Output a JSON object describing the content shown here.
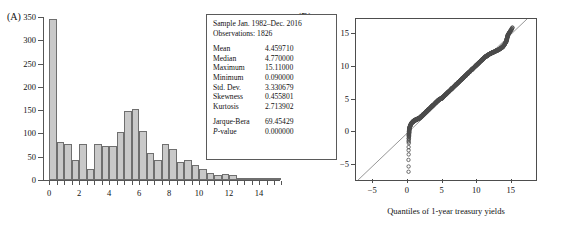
{
  "figure": {
    "panel_a_tag": "(A)",
    "panel_b_tag": "(B)"
  },
  "stats_box": {
    "sample": "Sample Jan. 1982–Dec. 2016",
    "observations": "Observations: 1826",
    "rows": [
      {
        "key": "Mean",
        "value": "4.459710"
      },
      {
        "key": "Median",
        "value": "4.770000"
      },
      {
        "key": "Maximum",
        "value": "15.11000"
      },
      {
        "key": "Minimum",
        "value": "0.090000"
      },
      {
        "key": "Std. Dev.",
        "value": "3.330679"
      },
      {
        "key": "Skewness",
        "value": "0.455801"
      },
      {
        "key": "Kurtosis",
        "value": "2.713902"
      }
    ],
    "test_rows": [
      {
        "key": "Jarque-Bera",
        "value": "69.45429"
      },
      {
        "key": "P-value",
        "value": "0.000000"
      }
    ]
  },
  "chart_data": [
    {
      "type": "bar",
      "title": "",
      "panel": "A",
      "xlabel": "",
      "ylabel": "",
      "xlim": [
        -0.35,
        15.4
      ],
      "ylim": [
        0,
        350
      ],
      "ytick_labels": [
        "0",
        "50",
        "100",
        "150",
        "200",
        "250",
        "300",
        "350"
      ],
      "yticks": [
        0,
        50,
        100,
        150,
        200,
        250,
        300,
        350
      ],
      "xtick_labels": [
        "0",
        "2",
        "4",
        "6",
        "8",
        "10",
        "12",
        "14"
      ],
      "xticks": [
        0,
        2,
        4,
        6,
        8,
        10,
        12,
        14
      ],
      "bin_width": 0.5,
      "bin_starts": [
        0.0,
        0.5,
        1.0,
        1.5,
        2.0,
        2.5,
        3.0,
        3.5,
        4.0,
        4.5,
        5.0,
        5.5,
        6.0,
        6.5,
        7.0,
        7.5,
        8.0,
        8.5,
        9.0,
        9.5,
        10.0,
        10.5,
        11.0,
        11.5,
        12.0,
        12.5,
        13.0,
        13.5,
        14.0,
        14.5,
        15.0
      ],
      "categories": [
        "0.0-0.5",
        "0.5-1.0",
        "1.0-1.5",
        "1.5-2.0",
        "2.0-2.5",
        "2.5-3.0",
        "3.0-3.5",
        "3.5-4.0",
        "4.0-4.5",
        "4.5-5.0",
        "5.0-5.5",
        "5.5-6.0",
        "6.0-6.5",
        "6.5-7.0",
        "7.0-7.5",
        "7.5-8.0",
        "8.0-8.5",
        "8.5-9.0",
        "9.0-9.5",
        "9.5-10.0",
        "10.0-10.5",
        "10.5-11.0",
        "11.0-11.5",
        "11.5-12.0",
        "12.0-12.5",
        "12.5-13.0",
        "13.0-13.5",
        "13.5-14.0",
        "14.0-14.5",
        "14.5-15.0",
        "15.0-15.5"
      ],
      "values": [
        346,
        81,
        77,
        44,
        78,
        23,
        77,
        74,
        74,
        104,
        148,
        152,
        105,
        57,
        42,
        77,
        66,
        38,
        43,
        33,
        23,
        15,
        10,
        12,
        10,
        4,
        4,
        3,
        3,
        3,
        2
      ],
      "bar_fill": "#c9c9c9",
      "bar_edge": "#6f6f6f",
      "grid": false
    },
    {
      "type": "scatter",
      "panel": "B",
      "title": "",
      "xlabel": "Quantiles of 1-year treasury yields",
      "ylabel": "Quantiles of normal",
      "xlim": [
        -7.5,
        18.5
      ],
      "ylim": [
        -7.2,
        17.2
      ],
      "xtick_labels": [
        "−5",
        "0",
        "5",
        "10",
        "15"
      ],
      "xticks": [
        -5,
        0,
        5,
        10,
        15
      ],
      "ytick_labels": [
        "−5",
        "0",
        "5",
        "10",
        "15"
      ],
      "yticks": [
        -5,
        0,
        5,
        10,
        15
      ],
      "reference_line": {
        "slope": 1,
        "intercept": 0,
        "color": "#8a8a8a"
      },
      "marker": "open-circle",
      "marker_color": "#4a4a4a",
      "grid": false,
      "note": "Q-Q plot: sample quantiles of 1-year treasury yields vs normal quantiles; dense band follows 45-degree line with low-end outliers near x=0.1 at y=-1.6, -3.3, -6.0",
      "points": [
        [
          0.09,
          -6.0
        ],
        [
          0.1,
          -3.3
        ],
        [
          0.11,
          -1.6
        ],
        [
          0.12,
          -1.0
        ],
        [
          0.13,
          -0.6
        ],
        [
          0.14,
          -0.35
        ],
        [
          0.15,
          -0.15
        ],
        [
          0.16,
          0.0
        ],
        [
          0.17,
          0.15
        ],
        [
          0.18,
          0.3
        ],
        [
          0.2,
          0.45
        ],
        [
          0.22,
          0.6
        ],
        [
          0.25,
          0.7
        ],
        [
          0.28,
          0.8
        ],
        [
          0.3,
          0.9
        ],
        [
          0.33,
          1.0
        ],
        [
          0.36,
          1.1
        ],
        [
          0.4,
          1.2
        ],
        [
          0.45,
          1.3
        ],
        [
          0.5,
          1.4
        ],
        [
          0.6,
          1.5
        ],
        [
          0.7,
          1.6
        ],
        [
          0.8,
          1.7
        ],
        [
          0.9,
          1.8
        ],
        [
          1.0,
          1.85
        ],
        [
          1.1,
          1.9
        ],
        [
          1.2,
          1.95
        ],
        [
          1.3,
          2.0
        ],
        [
          1.4,
          2.05
        ],
        [
          1.5,
          2.1
        ],
        [
          1.6,
          2.15
        ],
        [
          1.7,
          2.2
        ],
        [
          1.8,
          2.3
        ],
        [
          1.9,
          2.4
        ],
        [
          2.0,
          2.5
        ],
        [
          2.1,
          2.6
        ],
        [
          2.2,
          2.7
        ],
        [
          2.3,
          2.8
        ],
        [
          2.4,
          2.9
        ],
        [
          2.5,
          3.0
        ],
        [
          2.7,
          3.2
        ],
        [
          2.9,
          3.4
        ],
        [
          3.1,
          3.6
        ],
        [
          3.3,
          3.8
        ],
        [
          3.5,
          4.0
        ],
        [
          3.7,
          4.2
        ],
        [
          3.9,
          4.4
        ],
        [
          4.1,
          4.6
        ],
        [
          4.3,
          4.8
        ],
        [
          4.5,
          5.0
        ],
        [
          4.7,
          5.1
        ],
        [
          4.9,
          5.2
        ],
        [
          5.0,
          5.3
        ],
        [
          5.2,
          5.5
        ],
        [
          5.4,
          5.7
        ],
        [
          5.6,
          5.9
        ],
        [
          5.8,
          6.1
        ],
        [
          6.0,
          6.3
        ],
        [
          6.2,
          6.5
        ],
        [
          6.4,
          6.7
        ],
        [
          6.6,
          6.9
        ],
        [
          6.8,
          7.1
        ],
        [
          7.0,
          7.3
        ],
        [
          7.2,
          7.5
        ],
        [
          7.4,
          7.7
        ],
        [
          7.6,
          7.9
        ],
        [
          7.8,
          8.1
        ],
        [
          8.0,
          8.3
        ],
        [
          8.2,
          8.5
        ],
        [
          8.4,
          8.7
        ],
        [
          8.6,
          8.9
        ],
        [
          8.8,
          9.1
        ],
        [
          9.0,
          9.3
        ],
        [
          9.2,
          9.5
        ],
        [
          9.4,
          9.7
        ],
        [
          9.6,
          9.9
        ],
        [
          9.8,
          10.1
        ],
        [
          10.0,
          10.3
        ],
        [
          10.2,
          10.5
        ],
        [
          10.4,
          10.7
        ],
        [
          10.6,
          10.9
        ],
        [
          10.8,
          11.1
        ],
        [
          11.0,
          11.3
        ],
        [
          11.2,
          11.5
        ],
        [
          11.4,
          11.6
        ],
        [
          11.6,
          11.75
        ],
        [
          11.8,
          11.9
        ],
        [
          12.0,
          12.0
        ],
        [
          12.2,
          12.1
        ],
        [
          12.4,
          12.2
        ],
        [
          12.6,
          12.3
        ],
        [
          12.8,
          12.4
        ],
        [
          13.0,
          12.5
        ],
        [
          13.2,
          12.6
        ],
        [
          13.4,
          12.75
        ],
        [
          13.6,
          12.9
        ],
        [
          13.8,
          13.1
        ],
        [
          14.0,
          13.4
        ],
        [
          14.2,
          13.8
        ],
        [
          14.3,
          14.2
        ],
        [
          14.4,
          14.6
        ],
        [
          14.5,
          14.9
        ],
        [
          14.7,
          15.2
        ],
        [
          15.11,
          15.9
        ]
      ]
    }
  ]
}
